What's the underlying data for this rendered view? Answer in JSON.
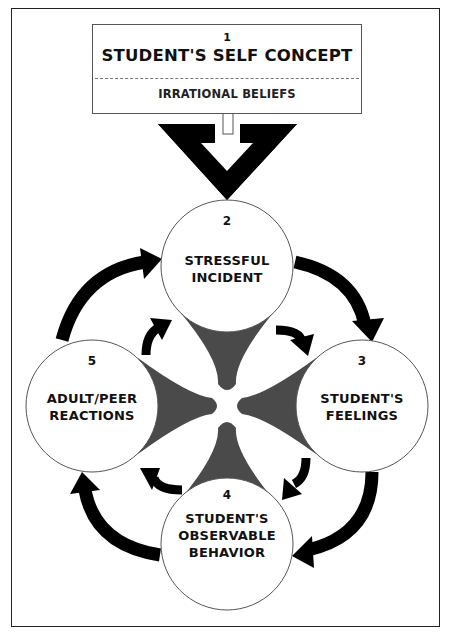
{
  "diagram": {
    "top_box": {
      "number": "1",
      "title": "STUDENT'S SELF CONCEPT",
      "subtitle": "IRRATIONAL BELIEFS"
    },
    "nodes": [
      {
        "number": "2",
        "lines": [
          "STRESSFUL",
          "INCIDENT"
        ]
      },
      {
        "number": "3",
        "lines": [
          "STUDENT'S",
          "FEELINGS"
        ]
      },
      {
        "number": "4",
        "lines": [
          "STUDENT'S",
          "OBSERVABLE",
          "BEHAVIOR"
        ]
      },
      {
        "number": "5",
        "lines": [
          "ADULT/PEER",
          "REACTIONS"
        ]
      }
    ],
    "cycle_order": [
      "2",
      "3",
      "4",
      "5",
      "2"
    ],
    "colors": {
      "arrow": "#000000",
      "center_shape": "#4a4a4a",
      "circle_stroke": "#555555",
      "frame": "#222222"
    }
  }
}
